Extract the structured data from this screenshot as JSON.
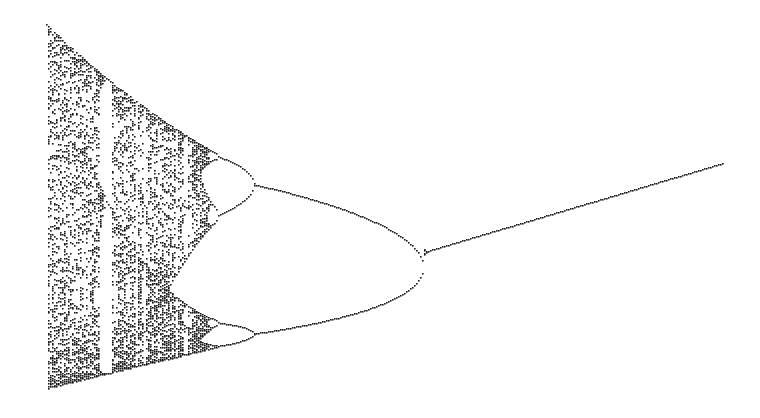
{
  "chart_data": {
    "type": "scatter",
    "xlabel": "",
    "ylabel": "",
    "grid": false,
    "legend": null,
    "r_range": [
      4.0,
      2.2
    ],
    "x_range": [
      0.0,
      1.0
    ],
    "features": {
      "chaotic_region_r": [
        3.57,
        4.0
      ],
      "period3_window_r": [
        3.828,
        3.857
      ],
      "period4_bifurcation_r": 3.449,
      "period2_bifurcation_r": 3.0,
      "fixed_point_end_r": 2.2
    },
    "pixel_landmarks": {
      "left_edge_x": 46,
      "top_y": 24,
      "bottom_y": 388,
      "period3_window_x": [
        107,
        123
      ],
      "period4_split_upper": [
        270,
        188
      ],
      "period4_split_lower": [
        268,
        315
      ],
      "period2_split": [
        423,
        252
      ],
      "right_end": [
        722,
        163
      ]
    },
    "point_color": "#1a1a1a",
    "background": "#ffffff"
  }
}
